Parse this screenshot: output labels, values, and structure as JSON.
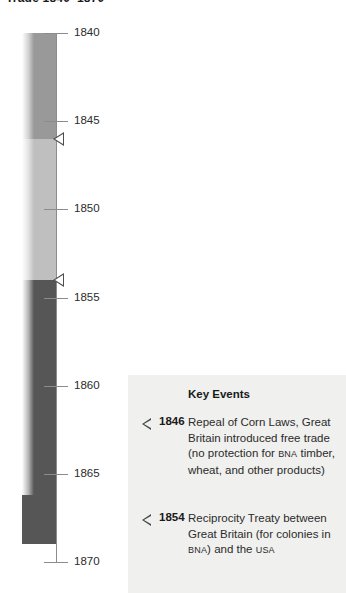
{
  "title": "Trade 1840–1870",
  "chart_data": {
    "type": "timeline",
    "title": "Trade 1840–1870",
    "orientation": "vertical",
    "axis": {
      "label": "",
      "range": [
        1840,
        1870
      ],
      "tick_interval": 5,
      "ticks": [
        {
          "value": 1840,
          "label": "1840"
        },
        {
          "value": 1845,
          "label": "1845"
        },
        {
          "value": 1850,
          "label": "1850"
        },
        {
          "value": 1855,
          "label": "1855"
        },
        {
          "value": 1860,
          "label": "1860"
        },
        {
          "value": 1865,
          "label": "1865"
        },
        {
          "value": 1870,
          "label": "1870"
        }
      ],
      "grid": false
    },
    "bar": {
      "start": 1840,
      "end": 1869,
      "segments": [
        {
          "name": "mercantilism / protected colonial trade",
          "start": 1840,
          "end": 1846,
          "color": "#999999"
        },
        {
          "name": "transition to free trade",
          "start": 1846,
          "end": 1854,
          "color": "#bfbfbf"
        },
        {
          "name": "reciprocity era",
          "start": 1854,
          "end": 1869,
          "color": "#565656"
        }
      ]
    },
    "markers": [
      {
        "year": 1846,
        "label": "1846"
      },
      {
        "year": 1854,
        "label": "1854"
      }
    ],
    "legend": {
      "position": "bottom-right",
      "title": "Key Events",
      "entries": [
        {
          "year": "1846",
          "text_parts": [
            {
              "t": "Repeal of Corn Laws, Great Britain introduced free trade (no protection for ",
              "sc": false
            },
            {
              "t": "BNA",
              "sc": true
            },
            {
              "t": " timber, wheat, and other products)",
              "sc": false
            }
          ]
        },
        {
          "year": "1854",
          "text_parts": [
            {
              "t": "Reciprocity Treaty between Great Britain (for colonies in ",
              "sc": false
            },
            {
              "t": "BNA",
              "sc": true
            },
            {
              "t": ") and the ",
              "sc": false
            },
            {
              "t": "USA",
              "sc": true
            }
          ]
        }
      ]
    },
    "colors": {
      "axis": "#8c8c8c",
      "text": "#2b2b2b",
      "panel_background": "#f0f0ee",
      "marker": "#4d4d4d"
    }
  }
}
